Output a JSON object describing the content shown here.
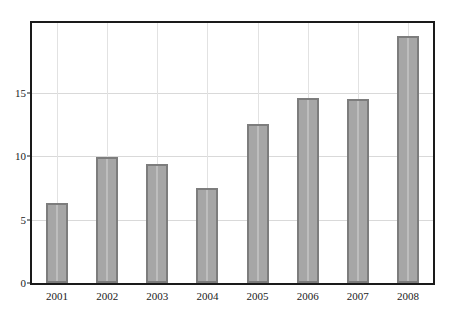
{
  "chart_data": {
    "type": "bar",
    "title": "",
    "subtitle": "",
    "xlabel": "",
    "ylabel": "",
    "categories": [
      "2001",
      "2002",
      "2003",
      "2004",
      "2005",
      "2006",
      "2007",
      "2008"
    ],
    "values": [
      6.3,
      9.9,
      9.4,
      7.5,
      12.5,
      14.6,
      14.5,
      19.5
    ],
    "ylim": [
      0,
      20.5
    ],
    "yticks": [
      0,
      5,
      10,
      15
    ],
    "ytick_labels": [
      "0",
      "5",
      "10",
      "15"
    ],
    "grid": "both",
    "legend": "none",
    "series": [
      {
        "name": "",
        "values": [
          6.3,
          9.9,
          9.4,
          7.5,
          12.5,
          14.6,
          14.5,
          19.5
        ]
      }
    ],
    "colors": {
      "bar_fill": "#a6a6a6",
      "bar_border": "#7d7d7d",
      "bar_stripe": "#bdbdbd",
      "grid_horizontal": "#d9d9d9",
      "grid_vertical": "#e2e2e2",
      "axis_frame": "#1a1a1a",
      "text": "#1a1a1a",
      "background": "#ffffff"
    }
  }
}
